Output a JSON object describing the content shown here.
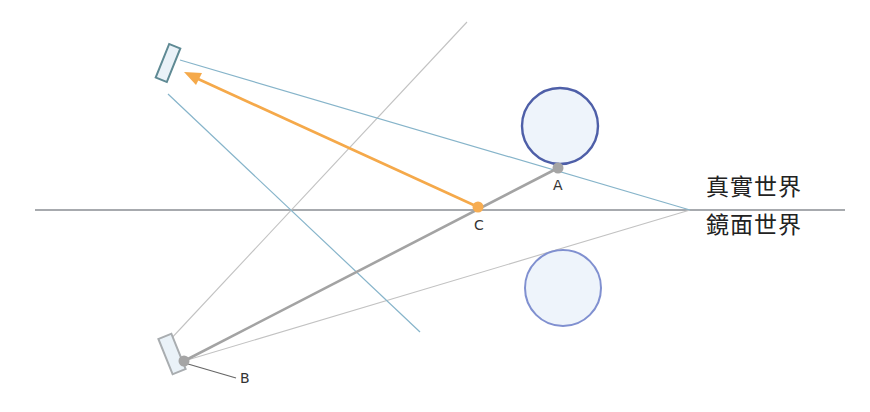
{
  "diagram": {
    "labels": {
      "point_a": "A",
      "point_b": "B",
      "point_c": "C",
      "real_world": "真實世界",
      "mirror_world": "鏡面世界"
    },
    "colors": {
      "mirror_line": "#8a8e93",
      "view_line_blue": "#7fb0c8",
      "thin_gray": "#bdbdbd",
      "ray_gray": "#a3a3a3",
      "arrow_orange": "#f5a94a",
      "point_gray": "#a5a5a5",
      "point_orange": "#f7ad52",
      "sphere_real_stroke": "#4e5fa8",
      "sphere_mirror_stroke": "#7f8fcf",
      "sphere_fill": "#eef4fb",
      "camera_stroke": "#5f8a94",
      "camera_fill": "#eaf2f8"
    },
    "points": {
      "A": {
        "x": 558,
        "y": 168
      },
      "B": {
        "x": 184,
        "y": 361
      },
      "C": {
        "x": 478,
        "y": 207
      }
    }
  }
}
